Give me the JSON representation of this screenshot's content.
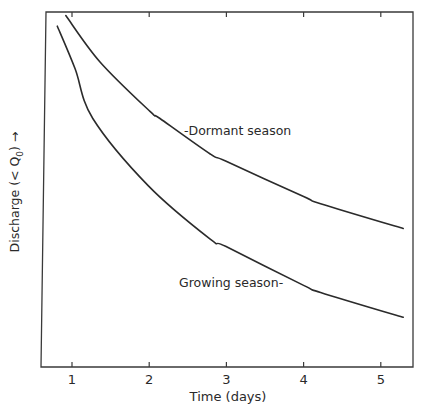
{
  "chart_data": {
    "type": "line",
    "title": "",
    "xlabel": "Time (days)",
    "ylabel": "Discharge (< Q₀) →",
    "ylabel_parts": {
      "main": "Discharge (< Q",
      "sub": "0",
      "tail": ") →"
    },
    "xlim": [
      0.6,
      5.43
    ],
    "ylim": [
      0,
      1
    ],
    "y_units_note": "relative (no y tick labels shown)",
    "x_ticks": [
      1,
      2,
      3,
      4,
      5
    ],
    "x_tick_labels": [
      "1",
      "2",
      "3",
      "4",
      "5"
    ],
    "grid": false,
    "legend": "none (inline curve labels)",
    "series": [
      {
        "name": "Dormant season",
        "label": "-Dormant season",
        "x": [
          0.92,
          1.36,
          2.01,
          2.14,
          2.79,
          2.99,
          4.0,
          4.22,
          5.29
        ],
        "y": [
          0.99,
          0.86,
          0.72,
          0.7,
          0.6,
          0.58,
          0.48,
          0.46,
          0.39
        ]
      },
      {
        "name": "Growing season",
        "label": "Growing season-",
        "x": [
          0.81,
          1.04,
          1.27,
          1.99,
          2.79,
          2.99,
          4.0,
          4.22,
          5.29
        ],
        "y": [
          0.96,
          0.84,
          0.7,
          0.51,
          0.36,
          0.34,
          0.23,
          0.21,
          0.14
        ]
      }
    ]
  }
}
